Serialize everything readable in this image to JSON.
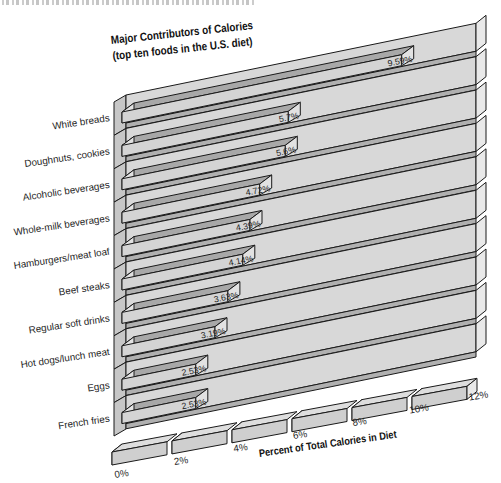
{
  "chart_data": {
    "type": "bar",
    "orientation": "horizontal",
    "style": "3d-perspective",
    "title": "Major Contributors of Calories",
    "subtitle": "(top ten foods in the U.S. diet)",
    "xlabel": "Percent of Total Calories in Diet",
    "categories": [
      "White breads",
      "Doughnuts, cookies",
      "Alcoholic beverages",
      "Whole-milk beverages",
      "Hamburgers/meat loaf",
      "Beef steaks",
      "Regular soft drinks",
      "Hot dogs/lunch meat",
      "Eggs",
      "French fries"
    ],
    "values": [
      9.59,
      5.7,
      5.6,
      4.72,
      4.39,
      4.14,
      3.63,
      3.19,
      2.53,
      2.53
    ],
    "value_labels": [
      "9.59%",
      "5.7%",
      "5.6%",
      "4.72%",
      "4.39%",
      "4.14%",
      "3.63%",
      "3.19%",
      "2.53%",
      "2.53%"
    ],
    "x_ticks": [
      "0%",
      "2%",
      "4%",
      "6%",
      "8%",
      "10%",
      "12%"
    ],
    "xlim": [
      0,
      12
    ],
    "grid": false,
    "legend": "none",
    "colors": {
      "background": "#ffffff",
      "outline": "#1a1a1a",
      "text": "#1f1f1f",
      "shelf": "#d8d8d8",
      "shelf_edge": "#b0b0b0",
      "shelf_cap": "#e9e9e9",
      "wall": "#c7c7c7",
      "bar_top": "#a8a8a8",
      "bar_front": "#d4d4d4",
      "bar_cap": "#e2e2e2",
      "ruler_top": "#dedede",
      "ruler_front": "#cfcfcf",
      "ruler_cap_dark": "#8f8f8f",
      "ruler_cap_light": "#e8e8e8"
    }
  }
}
